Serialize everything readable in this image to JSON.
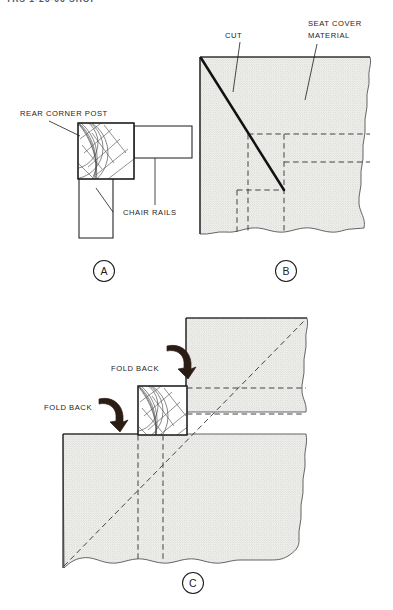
{
  "document": {
    "header_fragment": "TRS 1-26-06 SHOP",
    "title": "Chair Corner Seat Cover Fitting"
  },
  "colors": {
    "line": "#1c1c1c",
    "fabric_fill": "#f0f0ee",
    "fabric_dot": "#b9b9b4",
    "arrow": "#2b1d14",
    "cut_line": "#121212",
    "dashed": "#3a3a3a",
    "background": "#ffffff",
    "header_text": "#55555c"
  },
  "panels": [
    {
      "id": "a",
      "letter": "A",
      "caption_label": "A",
      "labels": [
        {
          "name": "rear-corner-post",
          "text": "REAR CORNER POST"
        },
        {
          "name": "chair-rails",
          "text": "CHAIR RAILS"
        }
      ]
    },
    {
      "id": "b",
      "letter": "B",
      "caption_label": "B",
      "labels": [
        {
          "name": "cut",
          "text": "CUT"
        },
        {
          "name": "seat-cover-material-line1",
          "text": "SEAT COVER"
        },
        {
          "name": "seat-cover-material-line2",
          "text": "MATERIAL"
        }
      ]
    },
    {
      "id": "c",
      "letter": "C",
      "caption_label": "C",
      "labels": [
        {
          "name": "fold-back-upper",
          "text": "FOLD BACK"
        },
        {
          "name": "fold-back-lower",
          "text": "FOLD  BACK"
        }
      ]
    }
  ]
}
